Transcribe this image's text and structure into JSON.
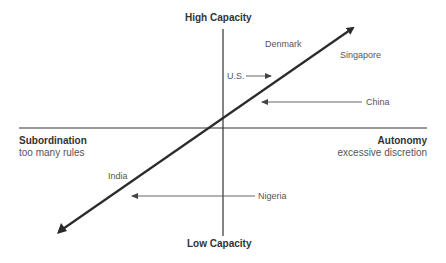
{
  "axes": {
    "top": {
      "label": "High Capacity"
    },
    "bottom": {
      "label": "Low Capacity"
    },
    "left": {
      "label": "Subordination",
      "sublabel": "too many rules"
    },
    "right": {
      "label": "Autonomy",
      "sublabel": "excessive discretion"
    }
  },
  "countries": [
    {
      "name": "Denmark",
      "arrow": "none"
    },
    {
      "name": "Singapore",
      "arrow": "none"
    },
    {
      "name": "U.S.",
      "arrow": "right"
    },
    {
      "name": "China",
      "arrow": "left"
    },
    {
      "name": "India",
      "arrow": "none"
    },
    {
      "name": "Nigeria",
      "arrow": "left"
    }
  ],
  "colors": {
    "axis": "#333333",
    "trend_line": "#2b2b2b",
    "pointer": "#555555",
    "text": "#555555"
  }
}
